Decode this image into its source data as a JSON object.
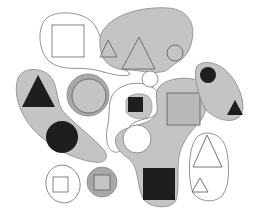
{
  "diagram": {
    "type": "euler-blobs-with-shapes",
    "colors": {
      "background": "#ffffff",
      "region_fill": "#c4c4c4",
      "region_dark": "#a8a8a8",
      "outline": "#777777",
      "black_shape": "#1e1e1e",
      "gray_shape": "#b8b8b8"
    },
    "regions": [
      {
        "name": "top-left-white-blob",
        "fill": "white",
        "contains": [
          "hollow-square"
        ]
      },
      {
        "name": "top-center-gray-blob",
        "fill": "gray",
        "contains": [
          "small-triangle-outline",
          "large-triangle-outline",
          "small-circle-outline"
        ]
      },
      {
        "name": "left-gray-blob",
        "fill": "gray",
        "contains": [
          "black-triangle",
          "black-circle"
        ]
      },
      {
        "name": "ringed-gray-circle",
        "fill": "gray",
        "contains": [
          "gray-circle"
        ]
      },
      {
        "name": "middle-gray-blob",
        "fill": "gray",
        "contains": [
          "black-square-small"
        ]
      },
      {
        "name": "center-gray-region",
        "fill": "gray",
        "contains": [
          "gray-square-large",
          "black-square-large"
        ]
      },
      {
        "name": "right-gray-blob",
        "fill": "gray",
        "contains": [
          "black-circle-small",
          "black-triangle-small"
        ]
      },
      {
        "name": "bottom-right-white-blob",
        "fill": "white",
        "contains": [
          "hollow-triangle-large",
          "hollow-triangle-small"
        ]
      },
      {
        "name": "bottom-left-white-ellipse",
        "fill": "white",
        "contains": [
          "hollow-square-small"
        ]
      },
      {
        "name": "bottom-gray-circle",
        "fill": "gray",
        "contains": [
          "gray-square-small"
        ]
      },
      {
        "name": "white-circle-center",
        "fill": "white",
        "contains": []
      }
    ]
  }
}
